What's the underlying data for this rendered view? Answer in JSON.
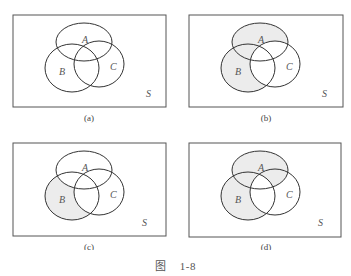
{
  "figure": {
    "caption_prefix": "图",
    "caption_number": "1-8",
    "shade_color": "#ececec",
    "stroke_color": "#333333",
    "panels": [
      {
        "id": "a",
        "label": "(a)",
        "universe": "S",
        "sets": [
          "A",
          "B",
          "C"
        ],
        "shaded": "none"
      },
      {
        "id": "b",
        "label": "(b)",
        "universe": "S",
        "sets": [
          "A",
          "B",
          "C"
        ],
        "shaded": "(A∪B)−C"
      },
      {
        "id": "c",
        "label": "(c)",
        "universe": "S",
        "sets": [
          "A",
          "B",
          "C"
        ],
        "shaded": "B−A−C"
      },
      {
        "id": "d",
        "label": "(d)",
        "universe": "S",
        "sets": [
          "A",
          "B",
          "C"
        ],
        "shaded": "(A∪B)−(B∩C)"
      }
    ]
  }
}
